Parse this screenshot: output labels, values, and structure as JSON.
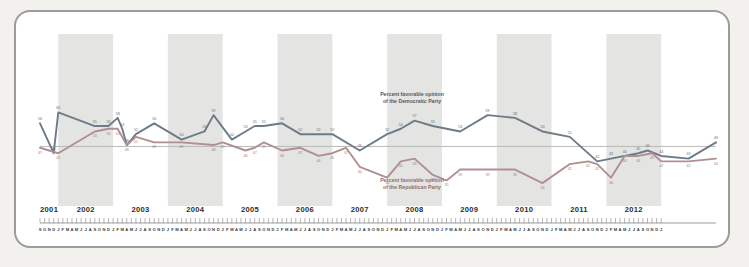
{
  "chart_data": {
    "type": "line",
    "title": "",
    "xlabel": "",
    "ylabel": "",
    "ylim": [
      30,
      62
    ],
    "grid": false,
    "legend_position": "inline-annotation",
    "annotations": [
      {
        "id": "dem",
        "text_line1": "Percent favorable opinion",
        "text_line2": "of the Democratic Party",
        "color": "#6d7b89"
      },
      {
        "id": "rep",
        "text_line1": "Percent favorable opinion",
        "text_line2": "of the Republican Party",
        "color": "#b08f92"
      }
    ],
    "years": [
      "2001",
      "2002",
      "2003",
      "2004",
      "2005",
      "2006",
      "2007",
      "2008",
      "2009",
      "2010",
      "2011",
      "2012"
    ],
    "shaded_years": [
      "2002",
      "2004",
      "2006",
      "2008",
      "2010",
      "2012"
    ],
    "month_ticks": "SONDJFMAMJJASONDJFMAMJJASONDJFMAMJJASONDJFMAMJJASONDJFMAMJJASONDJFMAMJJASONDJFMAMJJASONDJFMAMJJASONDJFMAMJJASONDJFMAMJJASONDJFMAMJJASONDJ",
    "start_month": "S",
    "start_year": 2001,
    "series": [
      {
        "name": "Percent favorable opinion of the Democratic Party",
        "color": "#6d7b89",
        "points": [
          {
            "t": 0,
            "v": 56,
            "label": "56"
          },
          {
            "t": 3,
            "v": 45,
            "label": "45"
          },
          {
            "t": 4,
            "v": 60,
            "label": "60"
          },
          {
            "t": 12,
            "v": 55,
            "label": "55"
          },
          {
            "t": 15,
            "v": 55,
            "label": "55"
          },
          {
            "t": 17,
            "v": 58,
            "label": "58"
          },
          {
            "t": 18,
            "v": 54,
            "label": "54"
          },
          {
            "t": 19,
            "v": 48,
            "label": "48"
          },
          {
            "t": 21,
            "v": 52,
            "label": "52"
          },
          {
            "t": 25,
            "v": 56,
            "label": "56"
          },
          {
            "t": 31,
            "v": 50,
            "label": "50"
          },
          {
            "t": 36,
            "v": 53,
            "label": "53"
          },
          {
            "t": 38,
            "v": 59,
            "label": "59"
          },
          {
            "t": 42,
            "v": 50,
            "label": "50"
          },
          {
            "t": 45,
            "v": 53,
            "label": "53"
          },
          {
            "t": 47,
            "v": 55,
            "label": "55"
          },
          {
            "t": 49,
            "v": 55,
            "label": "55"
          },
          {
            "t": 53,
            "v": 56,
            "label": "56"
          },
          {
            "t": 57,
            "v": 52,
            "label": "52"
          },
          {
            "t": 61,
            "v": 52,
            "label": "52"
          },
          {
            "t": 64,
            "v": 52,
            "label": "52"
          },
          {
            "t": 70,
            "v": 46,
            "label": "46"
          },
          {
            "t": 76,
            "v": 52,
            "label": "52"
          },
          {
            "t": 79,
            "v": 54,
            "label": "54"
          },
          {
            "t": 82,
            "v": 57,
            "label": "57"
          },
          {
            "t": 86,
            "v": 55,
            "label": "55"
          },
          {
            "t": 92,
            "v": 53,
            "label": "53"
          },
          {
            "t": 98,
            "v": 59,
            "label": "59"
          },
          {
            "t": 104,
            "v": 58,
            "label": "58"
          },
          {
            "t": 110,
            "v": 53,
            "label": "53"
          },
          {
            "t": 116,
            "v": 51,
            "label": "51"
          },
          {
            "t": 122,
            "v": 42,
            "label": "42"
          },
          {
            "t": 125,
            "v": 43,
            "label": "43"
          },
          {
            "t": 128,
            "v": 44,
            "label": "44"
          },
          {
            "t": 131,
            "v": 45,
            "label": "45"
          },
          {
            "t": 133,
            "v": 46,
            "label": "46"
          },
          {
            "t": 136,
            "v": 44,
            "label": "44"
          },
          {
            "t": 142,
            "v": 43,
            "label": "43"
          },
          {
            "t": 148,
            "v": 49,
            "label": "49"
          }
        ]
      },
      {
        "name": "Percent favorable opinion of the Republican Party",
        "color": "#b08f92",
        "points": [
          {
            "t": 0,
            "v": 47,
            "label": "47"
          },
          {
            "t": 4,
            "v": 45,
            "label": "45"
          },
          {
            "t": 12,
            "v": 53,
            "label": "53"
          },
          {
            "t": 15,
            "v": 54,
            "label": "54"
          },
          {
            "t": 17,
            "v": 54,
            "label": "54"
          },
          {
            "t": 19,
            "v": 48,
            "label": "48"
          },
          {
            "t": 21,
            "v": 51,
            "label": "51"
          },
          {
            "t": 25,
            "v": 49,
            "label": "49"
          },
          {
            "t": 31,
            "v": 49,
            "label": "49"
          },
          {
            "t": 38,
            "v": 48,
            "label": "48"
          },
          {
            "t": 40,
            "v": 49,
            "label": "49"
          },
          {
            "t": 45,
            "v": 46,
            "label": "46"
          },
          {
            "t": 47,
            "v": 47,
            "label": "47"
          },
          {
            "t": 49,
            "v": 49,
            "label": "49"
          },
          {
            "t": 53,
            "v": 46,
            "label": "46"
          },
          {
            "t": 57,
            "v": 47,
            "label": "47"
          },
          {
            "t": 61,
            "v": 44,
            "label": "44"
          },
          {
            "t": 64,
            "v": 45,
            "label": "45"
          },
          {
            "t": 67,
            "v": 47,
            "label": "47"
          },
          {
            "t": 70,
            "v": 40,
            "label": "40"
          },
          {
            "t": 76,
            "v": 36,
            "label": "36"
          },
          {
            "t": 79,
            "v": 42,
            "label": "42"
          },
          {
            "t": 82,
            "v": 43,
            "label": "43"
          },
          {
            "t": 86,
            "v": 37,
            "label": "37"
          },
          {
            "t": 89,
            "v": 35,
            "label": "35"
          },
          {
            "t": 92,
            "v": 39,
            "label": "39"
          },
          {
            "t": 98,
            "v": 39,
            "label": "39"
          },
          {
            "t": 104,
            "v": 39,
            "label": "39"
          },
          {
            "t": 110,
            "v": 34,
            "label": "34"
          },
          {
            "t": 116,
            "v": 41,
            "label": "41"
          },
          {
            "t": 120,
            "v": 42,
            "label": "42"
          },
          {
            "t": 122,
            "v": 41,
            "label": "41"
          },
          {
            "t": 125,
            "v": 36,
            "label": "36"
          },
          {
            "t": 128,
            "v": 44,
            "label": "44"
          },
          {
            "t": 131,
            "v": 44,
            "label": "44"
          },
          {
            "t": 134,
            "v": 45,
            "label": "45"
          },
          {
            "t": 136,
            "v": 42,
            "label": "42"
          },
          {
            "t": 142,
            "v": 42,
            "label": "42"
          },
          {
            "t": 148,
            "v": 43,
            "label": "43"
          }
        ]
      }
    ]
  }
}
